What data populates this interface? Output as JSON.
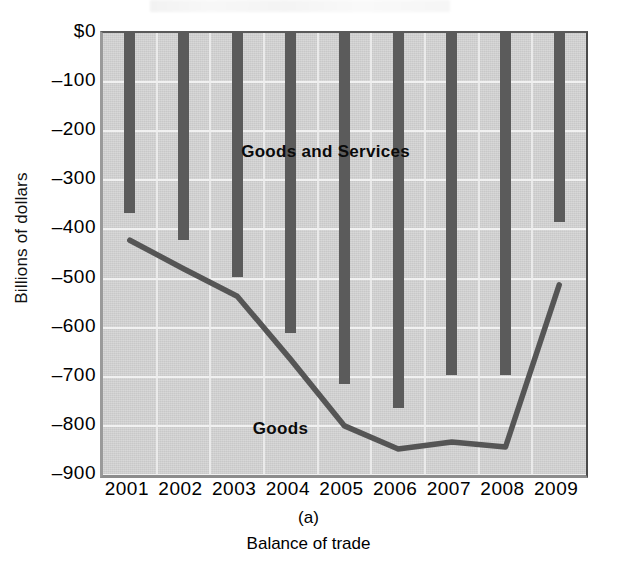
{
  "chart_data": {
    "type": "bar",
    "title": "",
    "panel_letter": "(a)",
    "caption": "Balance of trade",
    "xlabel": "",
    "ylabel": "Billions of dollars",
    "categories": [
      "2001",
      "2002",
      "2003",
      "2004",
      "2005",
      "2006",
      "2007",
      "2008",
      "2009"
    ],
    "ylim": [
      -900,
      0
    ],
    "ytick_labels": [
      "$0",
      "–100",
      "–200",
      "–300",
      "–400",
      "–500",
      "–600",
      "–700",
      "–800",
      "–900"
    ],
    "ytick_values": [
      0,
      -100,
      -200,
      -300,
      -400,
      -500,
      -600,
      -700,
      -800,
      -900
    ],
    "grid": true,
    "legend_position": "inline-annotation",
    "series": [
      {
        "name": "Goods and Services",
        "render": "bar",
        "color": "#5b5b5b",
        "values": [
          -367,
          -421,
          -496,
          -611,
          -715,
          -764,
          -697,
          -697,
          -385
        ]
      },
      {
        "name": "Goods",
        "render": "line",
        "color": "#555555",
        "values": [
          -422,
          -480,
          -536,
          -665,
          -800,
          -847,
          -833,
          -843,
          -513
        ]
      }
    ],
    "annotations": [
      {
        "text": "Goods and Services",
        "x_year": "2003",
        "y_value": -245
      },
      {
        "text": "Goods",
        "x_year": "2004",
        "y_value": -808
      }
    ]
  },
  "plot_style": {
    "plot_background": "#c8c8c8",
    "gridline_color": "#f2f2f2",
    "bar_color": "#5b5b5b",
    "line_color": "#555555"
  }
}
